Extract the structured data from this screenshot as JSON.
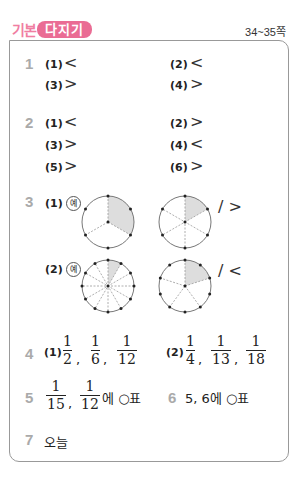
{
  "header": {
    "badge_light": "기본",
    "badge_dark": "다지기",
    "page_ref": "34~35쪽",
    "accent_color": "#ea6c94"
  },
  "q1": {
    "number": "1",
    "items": [
      {
        "label": "(1)",
        "answer": "<"
      },
      {
        "label": "(2)",
        "answer": "<"
      },
      {
        "label": "(3)",
        "answer": ">"
      },
      {
        "label": "(4)",
        "answer": ">"
      }
    ]
  },
  "q2": {
    "number": "2",
    "items": [
      {
        "label": "(1)",
        "answer": "<"
      },
      {
        "label": "(2)",
        "answer": ">"
      },
      {
        "label": "(3)",
        "answer": ">"
      },
      {
        "label": "(4)",
        "answer": "<"
      },
      {
        "label": "(5)",
        "answer": ">"
      },
      {
        "label": "(6)",
        "answer": ">"
      }
    ]
  },
  "q3": {
    "number": "3",
    "example_mark": "예",
    "items": [
      {
        "label": "(1)",
        "left_parts": 6,
        "left_shaded": 2,
        "right_parts": 6,
        "right_shaded": 1,
        "answer": "/ >"
      },
      {
        "label": "(2)",
        "left_parts": 12,
        "left_shaded": 1,
        "right_parts": 10,
        "right_shaded": 2,
        "answer": "/ <"
      }
    ]
  },
  "q4": {
    "number": "4",
    "items": [
      {
        "label": "(1)",
        "fractions": [
          {
            "n": "1",
            "d": "2"
          },
          {
            "n": "1",
            "d": "6"
          },
          {
            "n": "1",
            "d": "12"
          }
        ]
      },
      {
        "label": "(2)",
        "fractions": [
          {
            "n": "1",
            "d": "4"
          },
          {
            "n": "1",
            "d": "13"
          },
          {
            "n": "1",
            "d": "18"
          }
        ]
      }
    ]
  },
  "q5": {
    "number": "5",
    "fractions": [
      {
        "n": "1",
        "d": "15"
      },
      {
        "n": "1",
        "d": "12"
      }
    ],
    "suffix": "에 ○표"
  },
  "q6": {
    "number": "6",
    "text": "5, 6에 ○표"
  },
  "q7": {
    "number": "7",
    "text": "오늘"
  },
  "separator": ","
}
